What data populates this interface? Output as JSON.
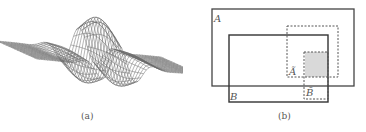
{
  "figure": {
    "panels": [
      {
        "id": "a",
        "caption": "(a)",
        "content": "3D wireframe surface plot of an oscillating wave packet (Gabor-like function)",
        "colors": {
          "mesh": "#6a6a6a",
          "dark": "#2a2a2a",
          "light": "#bdbdbd"
        }
      },
      {
        "id": "b",
        "caption": "(b)",
        "content": "Set diagram of overlapping rectangles",
        "rectangles": [
          {
            "label": "A",
            "style": "solid"
          },
          {
            "label": "B",
            "style": "solid"
          },
          {
            "label": "Ã",
            "style": "dashed"
          },
          {
            "label": "B̃",
            "style": "dashed"
          }
        ],
        "shaded_region": "intersection of Ã and B̃",
        "colors": {
          "solid": "#444444",
          "dashed": "#555555",
          "shade": "#d9d9d9"
        }
      }
    ]
  }
}
